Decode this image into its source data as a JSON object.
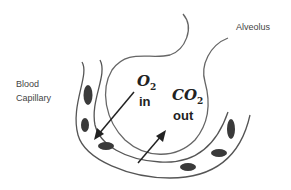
{
  "labels": {
    "alveolus": "Alveolus",
    "blood_capillary_line1": "Blood",
    "blood_capillary_line2": "Capillary"
  },
  "gases": {
    "o2": {
      "symbol": "O",
      "subscript": "2",
      "direction": "in"
    },
    "co2": {
      "symbol": "CO",
      "subscript": "2",
      "direction": "out"
    }
  },
  "colors": {
    "stroke": "#555555",
    "cell": "#3a3a3a",
    "text": "#444444"
  }
}
